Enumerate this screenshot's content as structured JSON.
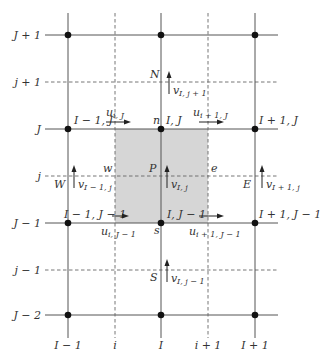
{
  "diagram": {
    "shade_color": "#cfcfcf",
    "line_color": "#555555",
    "node_color": "#111111"
  },
  "axes": {
    "rows_solid": [
      {
        "label": "J + 1",
        "y": 35
      },
      {
        "label": "J",
        "y": 129
      },
      {
        "label": "J − 1",
        "y": 223
      },
      {
        "label": "J − 2",
        "y": 315
      }
    ],
    "rows_dashed": [
      {
        "label": "j + 1",
        "y": 82
      },
      {
        "label": "j",
        "y": 176
      },
      {
        "label": "j − 1",
        "y": 270
      }
    ],
    "cols_solid": [
      {
        "label": "I − 1",
        "x": 68
      },
      {
        "label": "I",
        "x": 161
      },
      {
        "label": "I + 1",
        "x": 255
      }
    ],
    "cols_dashed": [
      {
        "label": "i",
        "x": 115
      },
      {
        "label": "i + 1",
        "x": 208
      }
    ]
  },
  "node_labels": {
    "im1_J": "I − 1, J",
    "I_J": "I, J",
    "ip1_J": "I + 1, J",
    "im1_Jm1": "I − 1, J − 1",
    "I_Jm1": "I, J − 1",
    "ip1_Jm1": "I + 1, J − 1"
  },
  "face_labels": {
    "n": "n",
    "s": "s",
    "w": "w",
    "e": "e",
    "P": "P",
    "N": "N",
    "S": "S",
    "W": "W",
    "E": "E"
  },
  "velocity_labels": {
    "u_i_J": {
      "base": "u",
      "sub": "i, J"
    },
    "u_ip1_J": {
      "base": "u",
      "sub": "i + 1, J"
    },
    "u_i_Jm1": {
      "base": "u",
      "sub": "i, J − 1"
    },
    "u_ip1_Jm1": {
      "base": "u",
      "sub": "i + 1, J − 1"
    },
    "v_I_jp1": {
      "base": "v",
      "sub": "I, j + 1"
    },
    "v_I_j": {
      "base": "v",
      "sub": "I, j"
    },
    "v_I_jm1": {
      "base": "v",
      "sub": "I, j − 1"
    },
    "v_Im1_j": {
      "base": "v",
      "sub": "I − 1, j"
    },
    "v_Ip1_j": {
      "base": "v",
      "sub": "I + 1, j"
    }
  }
}
